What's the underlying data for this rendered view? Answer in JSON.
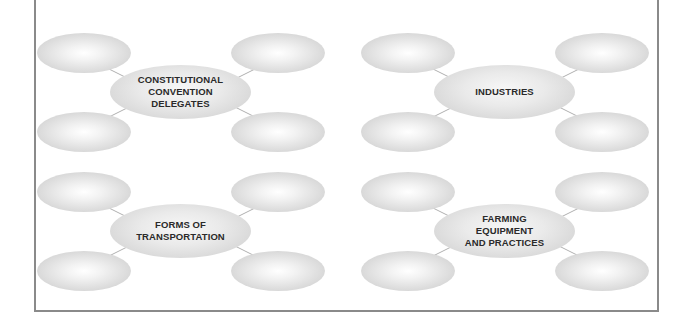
{
  "diagram": {
    "type": "concept-web-worksheet",
    "webs": [
      {
        "id": "web-1",
        "center_label": "CONSTITUTIONAL\nCONVENTION\nDELEGATES",
        "branches": [
          "",
          "",
          "",
          ""
        ]
      },
      {
        "id": "web-2",
        "center_label": "INDUSTRIES",
        "branches": [
          "",
          "",
          "",
          ""
        ]
      },
      {
        "id": "web-3",
        "center_label": "FORMS OF\nTRANSPORTATION",
        "branches": [
          "",
          "",
          "",
          ""
        ]
      },
      {
        "id": "web-4",
        "center_label": "FARMING\nEQUIPMENT\nAND PRACTICES",
        "branches": [
          "",
          "",
          "",
          ""
        ]
      }
    ]
  },
  "colors": {
    "border": "#8a8a8a",
    "oval_edge": "#c4c4c4",
    "oval_highlight": "#ffffff",
    "connector": "#b0b0b0",
    "text": "#2a2a2a"
  }
}
